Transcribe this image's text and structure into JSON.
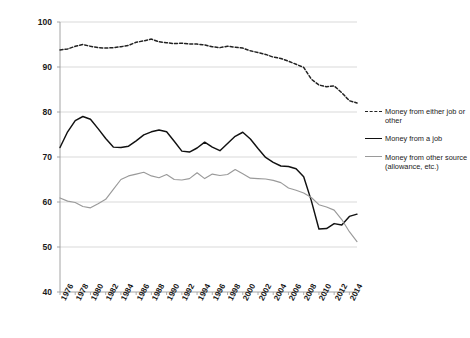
{
  "chart_data": {
    "type": "line",
    "title": "",
    "subtitle": "",
    "xlabel": "",
    "ylabel": "",
    "xlim": [
      1976,
      2015
    ],
    "ylim": [
      40,
      100
    ],
    "yticks": [
      40,
      50,
      60,
      70,
      80,
      90,
      100
    ],
    "ytick_labels": [
      "40",
      "50",
      "60",
      "70",
      "80",
      "90",
      "100"
    ],
    "grid": true,
    "grid_axis": "y",
    "legend_position": "right",
    "x": [
      1976,
      1977,
      1978,
      1979,
      1980,
      1981,
      1982,
      1983,
      1984,
      1985,
      1986,
      1987,
      1988,
      1989,
      1990,
      1991,
      1992,
      1993,
      1994,
      1995,
      1996,
      1997,
      1998,
      1999,
      2000,
      2001,
      2002,
      2003,
      2004,
      2005,
      2006,
      2007,
      2008,
      2009,
      2010,
      2011,
      2012,
      2013,
      2014,
      2015
    ],
    "xticks": [
      1976,
      1978,
      1980,
      1982,
      1984,
      1986,
      1988,
      1990,
      1992,
      1994,
      1996,
      1998,
      2000,
      2002,
      2004,
      2006,
      2008,
      2010,
      2012,
      2014
    ],
    "xtick_labels": [
      "1976",
      "1978",
      "1980",
      "1982",
      "1984",
      "1986",
      "1988",
      "1990",
      "1992",
      "1994",
      "1996",
      "1998",
      "2000",
      "2002",
      "2004",
      "2006",
      "2008",
      "2010",
      "2012",
      "2014"
    ],
    "series": [
      {
        "name": "Money from either job or other",
        "style": "dashed",
        "color": "#222222",
        "values": [
          93.8,
          94.0,
          94.6,
          95.0,
          94.6,
          94.3,
          94.2,
          94.3,
          94.5,
          94.8,
          95.5,
          95.8,
          96.2,
          95.6,
          95.4,
          95.2,
          95.3,
          95.1,
          95.1,
          94.9,
          94.5,
          94.3,
          94.6,
          94.4,
          94.2,
          93.6,
          93.2,
          92.8,
          92.2,
          91.9,
          91.3,
          90.6,
          89.9,
          87.3,
          86.0,
          85.6,
          85.8,
          84.3,
          82.5,
          82.0
        ]
      },
      {
        "name": "Money from a job",
        "style": "solid",
        "color": "#111111",
        "values": [
          72.1,
          75.6,
          78.1,
          79.0,
          78.4,
          76.3,
          74.1,
          72.2,
          72.1,
          72.4,
          73.6,
          74.9,
          75.6,
          76.0,
          75.6,
          73.5,
          71.3,
          71.1,
          72.0,
          73.3,
          72.2,
          71.4,
          73.0,
          74.6,
          75.5,
          74.0,
          71.9,
          69.9,
          68.8,
          68.0,
          67.9,
          67.4,
          65.6,
          60.3,
          54.0,
          54.1,
          55.2,
          54.9,
          56.8,
          57.3
        ]
      },
      {
        "name": "Money from other source (allowance, etc.)",
        "style": "solid",
        "color": "#9a9a9a",
        "values": [
          60.9,
          60.2,
          59.9,
          59.0,
          58.7,
          59.6,
          60.6,
          62.8,
          65.0,
          65.8,
          66.2,
          66.6,
          65.8,
          65.4,
          66.1,
          65.0,
          64.9,
          65.2,
          66.5,
          65.2,
          66.2,
          65.9,
          66.1,
          67.2,
          66.3,
          65.3,
          65.2,
          65.1,
          64.8,
          64.3,
          63.1,
          62.6,
          62.0,
          61.0,
          59.4,
          58.9,
          58.2,
          56.1,
          53.4,
          51.2
        ]
      }
    ]
  },
  "legend": {
    "entries": [
      {
        "label": "Money from either job or other",
        "swatch": "dashed-line-swatch"
      },
      {
        "label": "Money from a job",
        "swatch": "solid-black-line-swatch"
      },
      {
        "label": "Money from other source (allowance, etc.)",
        "swatch": "solid-gray-line-swatch"
      }
    ]
  },
  "colors": {
    "series_either": "#222222",
    "series_job": "#111111",
    "series_other": "#9a9a9a",
    "gridline": "#cfcfcf",
    "axis": "#9a9a9a",
    "text": "#1a1a1a",
    "background": "#ffffff"
  }
}
